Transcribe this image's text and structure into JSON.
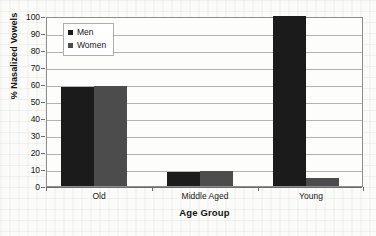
{
  "figure": {
    "background_color": "#fbfbfa",
    "plot_background_color": "#fdfdfc",
    "frame_color": "#8e8e8e",
    "gridline_color": "#b2b2b2"
  },
  "legend": {
    "position": "top-left-inside",
    "entries": [
      {
        "label": "Men",
        "color": "#1b1b1b",
        "swatch_icon": "square-marker-icon"
      },
      {
        "label": "Women",
        "color": "#4c4c4c",
        "swatch_icon": "square-marker-icon"
      }
    ]
  },
  "chart_data": {
    "type": "bar",
    "title": "",
    "subtitle": "",
    "xlabel": "Age Group",
    "ylabel": "% Nasalized Vowels",
    "categories": [
      "Old",
      "Middle Aged",
      "Young"
    ],
    "series": [
      {
        "name": "Men",
        "color": "#1b1b1b",
        "values": [
          58,
          8,
          100
        ]
      },
      {
        "name": "Women",
        "color": "#4c4c4c",
        "values": [
          59,
          9,
          5
        ]
      }
    ],
    "ylim": [
      0,
      100
    ],
    "ytick_step": 10,
    "yticks": [
      0,
      10,
      20,
      30,
      40,
      50,
      60,
      70,
      80,
      90,
      100
    ],
    "ytick_labels": [
      "0",
      "10",
      "20",
      "30",
      "40",
      "50",
      "60",
      "70",
      "80",
      "90",
      "100"
    ],
    "grid": {
      "horizontal": true,
      "vertical": false
    },
    "legend_position": "upper left",
    "bar_gap_within_group": 0,
    "orientation": "vertical"
  }
}
